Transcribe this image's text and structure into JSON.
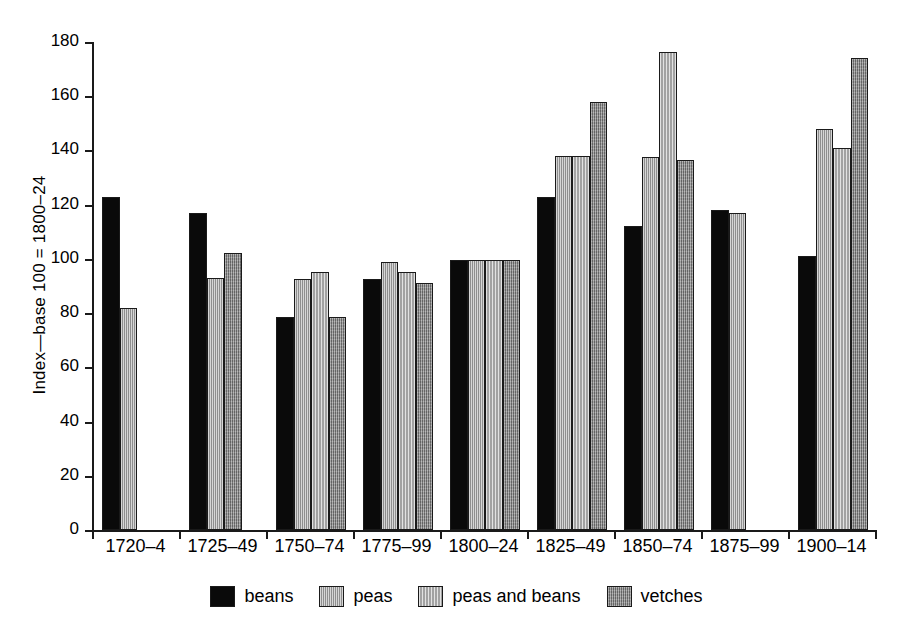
{
  "chart_data": {
    "type": "bar",
    "title": "",
    "xlabel": "",
    "ylabel": "Index—base 100 = 1800–24",
    "ylim": [
      0,
      180
    ],
    "ytick_step": 20,
    "yticks": [
      "0",
      "20",
      "40",
      "60",
      "80",
      "100",
      "120",
      "140",
      "160",
      "180"
    ],
    "grid": false,
    "legend_position": "bottom-center",
    "categories": [
      "1720–4",
      "1725–49",
      "1750–74",
      "1775–99",
      "1800–24",
      "1825–49",
      "1850–74",
      "1875–99",
      "1900–14"
    ],
    "series": [
      {
        "name": "beans",
        "color": "#0a0a0a",
        "values": [
          123,
          117,
          78.5,
          92.5,
          99.5,
          123,
          112,
          118,
          101
        ]
      },
      {
        "name": "peas",
        "color": "#a5a5a5",
        "values": [
          82,
          93,
          92.5,
          99,
          99.5,
          138,
          137.5,
          117,
          148
        ]
      },
      {
        "name": "peas and beans",
        "color": "#b4b4b4",
        "values": [
          null,
          null,
          95,
          95,
          99.5,
          138,
          176.5,
          null,
          141
        ]
      },
      {
        "name": "vetches",
        "color": "#8e8e8e",
        "values": [
          null,
          102,
          78.5,
          91,
          99.5,
          158,
          136.5,
          null,
          174
        ]
      }
    ],
    "legend": [
      {
        "label": "beans",
        "swatch": "beans"
      },
      {
        "label": "peas",
        "swatch": "peas"
      },
      {
        "label": "peas and beans",
        "swatch": "peasandbeans"
      },
      {
        "label": "vetches",
        "swatch": "vetches"
      }
    ]
  }
}
